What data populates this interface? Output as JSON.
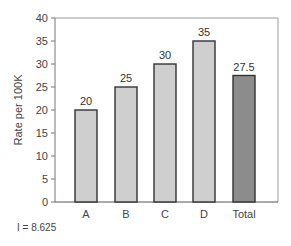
{
  "chart_data": {
    "type": "bar",
    "title": "",
    "xlabel": "",
    "ylabel": "Rate per 100K",
    "ylim": [
      0,
      40
    ],
    "yticks": [
      0,
      5,
      10,
      15,
      20,
      25,
      30,
      35,
      40
    ],
    "grid": false,
    "legend": null,
    "categories": [
      "A",
      "B",
      "C",
      "D",
      "Total"
    ],
    "values": [
      20,
      25,
      30,
      35,
      27.5
    ],
    "data_labels": [
      "20",
      "25",
      "30",
      "35",
      "27.5"
    ],
    "bar_colors": [
      "#cfcfcf",
      "#cfcfcf",
      "#cfcfcf",
      "#cfcfcf",
      "#8c8c8c"
    ],
    "annotations": [
      "I = 8.625"
    ]
  },
  "footnote": "I = 8.625"
}
